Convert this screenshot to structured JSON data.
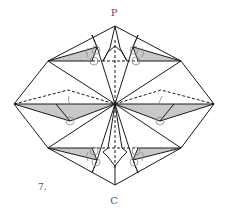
{
  "diagram": {
    "step_number": "7.",
    "top_label": "P",
    "bottom_label": "C",
    "colors": {
      "line": "#1a1a1a",
      "shade": "#c8c8c8",
      "circle": "#888888",
      "text": "#555555"
    },
    "vertices": {
      "top_apex": [
        115,
        26
      ],
      "upper_left": [
        48,
        61
      ],
      "upper_right": [
        181,
        61
      ],
      "left": [
        14,
        104
      ],
      "center": [
        115,
        104
      ],
      "right": [
        214,
        104
      ],
      "lower_left": [
        48,
        148
      ],
      "lower_right": [
        181,
        148
      ],
      "bottom_apex": [
        115,
        185
      ]
    },
    "line_types": [
      "solid edge",
      "dashed valley fold"
    ],
    "annotations": [
      "pivot circles at flap points",
      "curved fold arrows"
    ]
  }
}
